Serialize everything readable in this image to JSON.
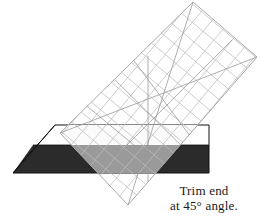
{
  "figure": {
    "width": 261,
    "height": 217,
    "background_color": "#ffffff"
  },
  "caption": {
    "line1": "Trim end",
    "line2": "at 45° angle."
  },
  "colors": {
    "fabric_dark": "#2b2b2b",
    "fabric_light": "#ffffff",
    "fabric_outline": "#111111",
    "ruler_overlay_on_dark": "#9a9a9a",
    "ruler_overlay_on_light": "#fdfdfd",
    "ruler_edge": "#a9a9a9",
    "ruler_grid": "#b8b8b8",
    "ruler_diagonal_line": "#8c8c8c",
    "caption_text": "#1a1a1a"
  },
  "geometry": {
    "fabric_top_left": [
      55,
      125
    ],
    "fabric_top_right": [
      209,
      125
    ],
    "fabric_bottom_right": [
      209,
      173
    ],
    "fabric_bottom_left": [
      13,
      173
    ],
    "fabric_band_split_y": 145,
    "ruler_corner_top": [
      193,
      2
    ],
    "ruler_corner_right": [
      257,
      57
    ],
    "ruler_corner_bottom": [
      128,
      205
    ],
    "ruler_corner_left": [
      60,
      133
    ],
    "ruler_grid_spacing": 14,
    "ruler_rotation_degrees": 45
  },
  "labels": {
    "ruler": "rotary-cutting-ruler",
    "fabric_dark_band": "dark-fabric-band",
    "fabric_light_band": "light-fabric-band",
    "trim_line": "45-degree-trim-line"
  }
}
